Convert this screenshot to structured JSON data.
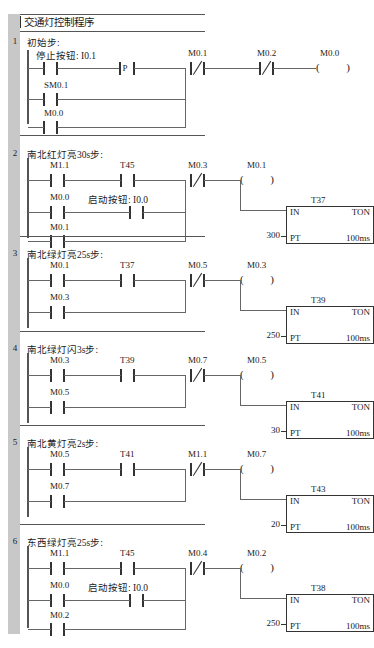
{
  "program": {
    "title": "交通灯控制程序",
    "title_marker": "|"
  },
  "labels": {
    "in": "IN",
    "ton": "TON",
    "pt": "PT",
    "timebase": "100ms",
    "p_transition": "P",
    "coil_open": "(",
    "coil_close": ")"
  },
  "networks": [
    {
      "number": "1",
      "comment": "初始步:",
      "branches": [
        {
          "contacts": [
            {
              "name": "停止按钮: I0.1",
              "type": "no"
            }
          ]
        },
        {
          "contacts": [
            {
              "name": "SM0.1",
              "type": "no"
            }
          ]
        },
        {
          "contacts": [
            {
              "name": "M0.0",
              "type": "no"
            }
          ]
        }
      ],
      "transition": "P",
      "series_after": [
        {
          "name": "M0.1",
          "type": "nc"
        },
        {
          "name": "M0.2",
          "type": "nc"
        }
      ],
      "coil": "M0.0",
      "timer": null
    },
    {
      "number": "2",
      "comment": "南北红灯亮30s步:",
      "branches": [
        {
          "contacts": [
            {
              "name": "M1.1",
              "type": "no"
            },
            {
              "name": "T45",
              "type": "no"
            }
          ]
        },
        {
          "contacts": [
            {
              "name": "M0.0",
              "type": "no"
            },
            {
              "name": "启动按钮: I0.0",
              "type": "no"
            }
          ]
        },
        {
          "contacts": [
            {
              "name": "M0.1",
              "type": "no"
            }
          ]
        }
      ],
      "transition": null,
      "series_after": [
        {
          "name": "M0.3",
          "type": "nc"
        }
      ],
      "coil": "M0.1",
      "timer": {
        "name": "T37",
        "preset": "300"
      }
    },
    {
      "number": "3",
      "comment": "南北绿灯亮25s步:",
      "branches": [
        {
          "contacts": [
            {
              "name": "M0.1",
              "type": "no"
            },
            {
              "name": "T37",
              "type": "no"
            }
          ]
        },
        {
          "contacts": [
            {
              "name": "M0.3",
              "type": "no"
            }
          ]
        }
      ],
      "transition": null,
      "series_after": [
        {
          "name": "M0.5",
          "type": "nc"
        }
      ],
      "coil": "M0.3",
      "timer": {
        "name": "T39",
        "preset": "250"
      }
    },
    {
      "number": "4",
      "comment": "南北绿灯闪3s步:",
      "branches": [
        {
          "contacts": [
            {
              "name": "M0.3",
              "type": "no"
            },
            {
              "name": "T39",
              "type": "no"
            }
          ]
        },
        {
          "contacts": [
            {
              "name": "M0.5",
              "type": "no"
            }
          ]
        }
      ],
      "transition": null,
      "series_after": [
        {
          "name": "M0.7",
          "type": "nc"
        }
      ],
      "coil": "M0.5",
      "timer": {
        "name": "T41",
        "preset": "30"
      }
    },
    {
      "number": "5",
      "comment": "南北黄灯亮2s步:",
      "branches": [
        {
          "contacts": [
            {
              "name": "M0.5",
              "type": "no"
            },
            {
              "name": "T41",
              "type": "no"
            }
          ]
        },
        {
          "contacts": [
            {
              "name": "M0.7",
              "type": "no"
            }
          ]
        }
      ],
      "transition": null,
      "series_after": [
        {
          "name": "M1.1",
          "type": "nc"
        }
      ],
      "coil": "M0.7",
      "timer": {
        "name": "T43",
        "preset": "20"
      }
    },
    {
      "number": "6",
      "comment": "东西绿灯亮25s步:",
      "branches": [
        {
          "contacts": [
            {
              "name": "M1.1",
              "type": "no"
            },
            {
              "name": "T45",
              "type": "no"
            }
          ]
        },
        {
          "contacts": [
            {
              "name": "M0.0",
              "type": "no"
            },
            {
              "name": "启动按钮: I0.0",
              "type": "no"
            }
          ]
        },
        {
          "contacts": [
            {
              "name": "M0.2",
              "type": "no"
            }
          ]
        }
      ],
      "transition": null,
      "series_after": [
        {
          "name": "M0.4",
          "type": "nc"
        }
      ],
      "coil": "M0.2",
      "timer": {
        "name": "T38",
        "preset": "250"
      }
    }
  ],
  "colors": {
    "gutter": "#c8c8c8",
    "line": "#555555",
    "wire": "#666666",
    "text": "#1a1a1a"
  }
}
